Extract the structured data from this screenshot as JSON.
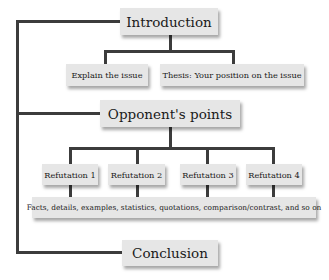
{
  "diagram": {
    "introduction": "Introduction",
    "intro_children": [
      "Explain the issue",
      "Thesis: Your position on the issue"
    ],
    "opponent": "Opponent's points",
    "refutations": [
      "Refutation 1",
      "Refutation 2",
      "Refutation 3",
      "Refutation 4"
    ],
    "evidence": "Facts, details, examples, statistics, quotations, comparison/contrast, and so on",
    "conclusion": "Conclusion"
  },
  "colors": {
    "line": "#3c3c3c",
    "box": "#e6e6e6",
    "text": "#1a1a1a"
  }
}
